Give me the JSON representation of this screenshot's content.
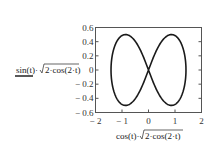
{
  "chart_data": {
    "type": "line",
    "title": "",
    "xlabel": "cos(t)·√(2·cos(2·t))",
    "ylabel": "sin(t)·√(2·cos(2·t))",
    "xlabel_parts": {
      "prefix": "cos(t)·",
      "radicand": "2·cos(2·t)"
    },
    "ylabel_parts": {
      "prefix": "sin(t)·",
      "radicand": "2·cos(2·t)"
    },
    "xlim": [
      -2,
      2
    ],
    "ylim": [
      -0.6,
      0.6
    ],
    "xticks": [
      "-2",
      "-1",
      "0",
      "1",
      "2"
    ],
    "yticks": [
      "0.6",
      "0.4",
      "0.2",
      "0",
      "-0.2",
      "-0.4",
      "-0.6"
    ],
    "grid": false,
    "series": [
      {
        "name": "lemniscate",
        "parametric": "x=cos(t)·sqrt(2cos(2t)), y=sin(t)·sqrt(2cos(2t))",
        "x_extent": [
          -1.414,
          1.414
        ],
        "y_extent": [
          -0.5,
          0.5
        ],
        "color": "#1a1a1a"
      }
    ]
  }
}
